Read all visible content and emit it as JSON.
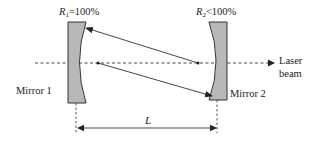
{
  "diagram": {
    "type": "laser-cavity",
    "labels": {
      "r1_symbol": "R",
      "r1_sub": "1",
      "r1_value": "=100%",
      "r2_symbol": "R",
      "r2_sub": "2",
      "r2_value": "<100%",
      "mirror1": "Mirror 1",
      "mirror2": "Mirror 2",
      "laser_line1": "Laser",
      "laser_line2": "beam",
      "length": "L"
    },
    "colors": {
      "mirror_fill": "#b8b8b8",
      "stroke": "#333333"
    }
  }
}
